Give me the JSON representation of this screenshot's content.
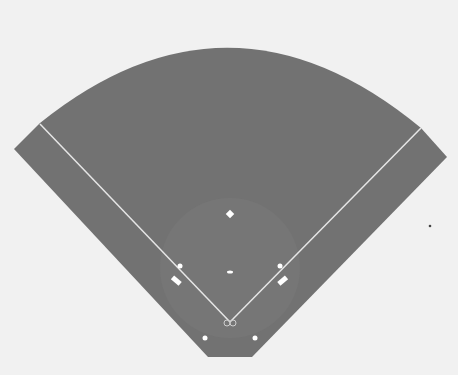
{
  "diagram": {
    "colors": {
      "background": "#f1f1f1",
      "field": "#727272",
      "infield": "#777777",
      "lines": "#e6e6e6",
      "markers": "#ffffff",
      "dot": "#444444"
    },
    "elements": {
      "home_plate": [
        230,
        323
      ],
      "first_base": [
        280,
        266
      ],
      "second_base": [
        230,
        214
      ],
      "third_base": [
        180,
        266
      ],
      "pitchers_mound": [
        230,
        272
      ],
      "left_foul_line_end": [
        40,
        124
      ],
      "right_foul_line_end": [
        421,
        128
      ],
      "left_dugout_marker": [
        176,
        281
      ],
      "right_dugout_marker": [
        283,
        281
      ],
      "left_bottom_dot": [
        205,
        338
      ],
      "right_bottom_dot": [
        255,
        338
      ],
      "stray_dot": [
        430,
        226
      ]
    }
  }
}
